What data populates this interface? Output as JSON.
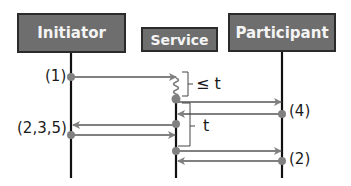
{
  "diagram": {
    "type": "sequence-diagram",
    "actors": [
      {
        "id": "initiator",
        "label": "Initiator"
      },
      {
        "id": "service",
        "label": "Service"
      },
      {
        "id": "participant",
        "label": "Participant"
      }
    ],
    "messages": [
      {
        "from": "initiator",
        "to": "service",
        "step_label": "(1)"
      },
      {
        "from": "service",
        "to": "participant"
      },
      {
        "from": "participant",
        "to": "service",
        "step_label": "(4)"
      },
      {
        "from": "service",
        "to": "initiator"
      },
      {
        "from": "initiator",
        "to": "service",
        "step_label": "(2,3,5)"
      },
      {
        "from": "service",
        "to": "participant"
      },
      {
        "from": "participant",
        "to": "service",
        "step_label": "(2)"
      }
    ],
    "annotations": {
      "delay_bracket": "≤ t",
      "interval_bracket": "t"
    },
    "labels": {
      "step1": "(1)",
      "step235": "(2,3,5)",
      "step4": "(4)",
      "step2": "(2)"
    },
    "colors": {
      "box_fill": "#6e6e6e",
      "box_border": "#2b2b2b",
      "box_text": "#f4f4f4",
      "lifeline": "#111111",
      "arrow": "#808080",
      "dot": "#808080"
    }
  }
}
